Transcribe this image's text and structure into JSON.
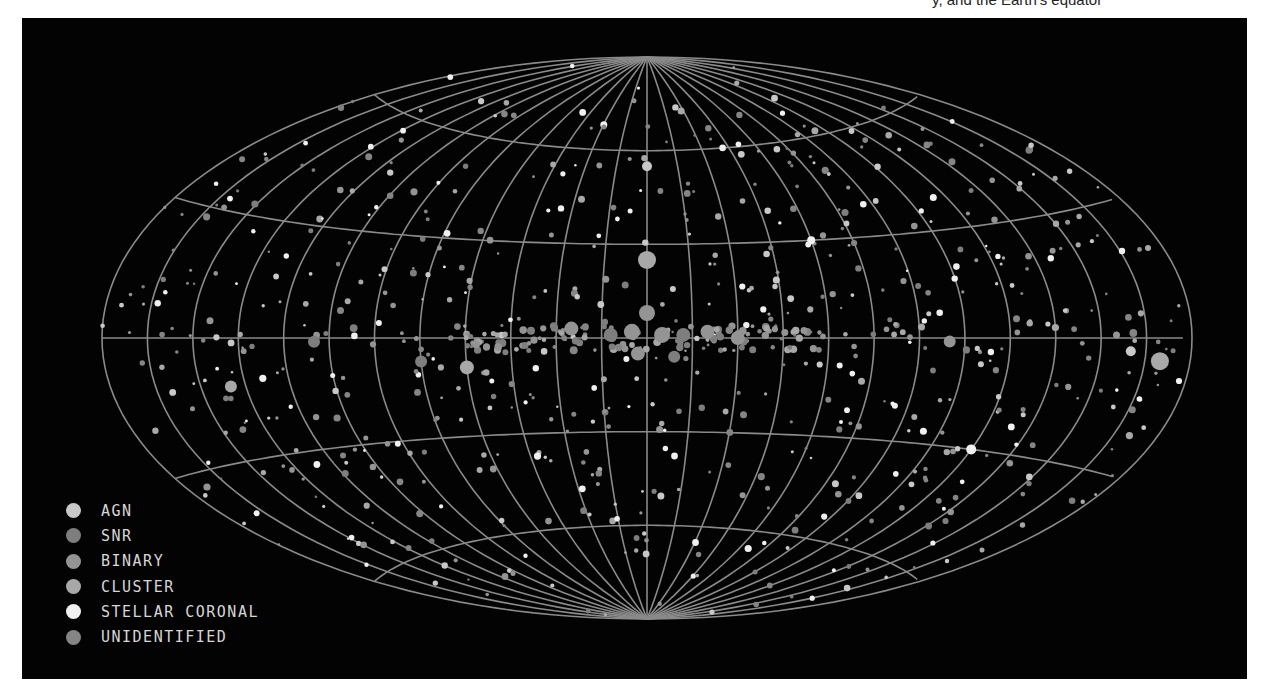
{
  "caption": {
    "text": "y, and the Earth's equator"
  },
  "chart_data": {
    "type": "scatter",
    "projection": "Aitoff (all-sky, galactic coordinates)",
    "title": "",
    "xlabel": "",
    "ylabel": "",
    "grid": {
      "meridian_step_deg": 15,
      "parallels_deg": [
        -60,
        -30,
        0,
        30,
        60
      ],
      "color": "#8a8a8a"
    },
    "legend_position": "lower-left",
    "legend": [
      {
        "label": "AGN",
        "color": "#c8c8c8"
      },
      {
        "label": "SNR",
        "color": "#7e7e7e"
      },
      {
        "label": "BINARY",
        "color": "#949494"
      },
      {
        "label": "CLUSTER",
        "color": "#a8a8a8"
      },
      {
        "label": "STELLAR CORONAL",
        "color": "#f0f0f0"
      },
      {
        "label": "UNIDENTIFIED",
        "color": "#858585"
      }
    ],
    "highlighted_sources": [
      {
        "l": 0,
        "b": 25,
        "class": "CLUSTER",
        "size": 9
      },
      {
        "l": 0,
        "b": 8,
        "class": "BINARY",
        "size": 8
      },
      {
        "l": 5,
        "b": 1,
        "class": "BINARY",
        "size": 8
      },
      {
        "l": -5,
        "b": 2,
        "class": "BINARY",
        "size": 8
      },
      {
        "l": 12,
        "b": 1,
        "class": "SNR",
        "size": 7
      },
      {
        "l": -12,
        "b": 1,
        "class": "SNR",
        "size": 7
      },
      {
        "l": 20,
        "b": 2,
        "class": "BINARY",
        "size": 7
      },
      {
        "l": -25,
        "b": 3,
        "class": "BINARY",
        "size": 7
      },
      {
        "l": 30,
        "b": 0,
        "class": "BINARY",
        "size": 7
      },
      {
        "l": -3,
        "b": -5,
        "class": "BINARY",
        "size": 7
      },
      {
        "l": 9,
        "b": -6,
        "class": "SNR",
        "size": 6
      },
      {
        "l": -60,
        "b": -9,
        "class": "CLUSTER",
        "size": 7
      },
      {
        "l": 100,
        "b": -1,
        "class": "BINARY",
        "size": 6
      },
      {
        "l": 170,
        "b": -5,
        "class": "CLUSTER",
        "size": 9
      },
      {
        "l": -75,
        "b": -7,
        "class": "SNR",
        "size": 6
      },
      {
        "l": -110,
        "b": -1,
        "class": "SNR",
        "size": 6
      },
      {
        "l": -140,
        "b": -12,
        "class": "CLUSTER",
        "size": 6
      },
      {
        "l": 160,
        "b": -3,
        "class": "AGN",
        "size": 5
      },
      {
        "l": 0,
        "b": 55,
        "class": "AGN",
        "size": 5
      },
      {
        "l": 60,
        "b": 30,
        "class": "STELLAR CORONAL",
        "size": 4
      },
      {
        "l": 120,
        "b": -30,
        "class": "STELLAR CORONAL",
        "size": 5
      }
    ]
  }
}
